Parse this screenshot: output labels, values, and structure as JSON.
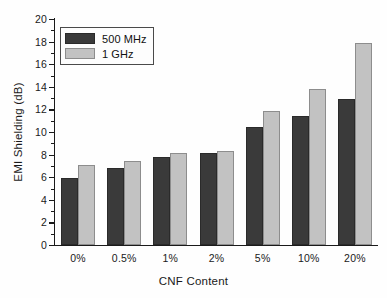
{
  "chart_data": {
    "type": "bar",
    "title": "",
    "xlabel": "CNF Content",
    "ylabel": "EMI Shielding (dB)",
    "categories": [
      "0%",
      "0.5%",
      "1%",
      "2%",
      "5%",
      "10%",
      "20%"
    ],
    "series": [
      {
        "name": "500 MHz",
        "color": "#3a3a3a",
        "values": [
          5.9,
          6.8,
          7.8,
          8.1,
          10.4,
          11.4,
          12.9
        ]
      },
      {
        "name": "1 GHz",
        "color": "#c2c2c2",
        "values": [
          7.1,
          7.4,
          8.1,
          8.3,
          11.9,
          13.8,
          17.9
        ]
      }
    ],
    "ylim": [
      0,
      20
    ],
    "ytick_values": [
      0,
      2,
      4,
      6,
      8,
      10,
      12,
      14,
      16,
      18,
      20
    ],
    "ytick_labels": [
      "0",
      "2",
      "4",
      "6",
      "8",
      "10",
      "12",
      "14",
      "16",
      "18",
      "20"
    ],
    "yminor_values": [
      1,
      3,
      5,
      7,
      9,
      11,
      13,
      15,
      17,
      19
    ],
    "grid": false,
    "legend_position": "upper-left",
    "legend_entries": [
      "500 MHz",
      "1 GHz"
    ]
  }
}
